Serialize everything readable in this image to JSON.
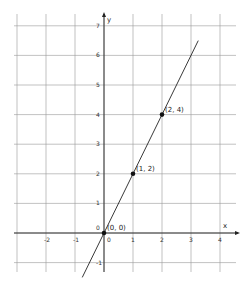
{
  "chart_data": {
    "type": "line",
    "title": "",
    "xlabel": "x",
    "ylabel": "y",
    "xlim": [
      -3,
      4.2
    ],
    "ylim": [
      -1.6,
      7.4
    ],
    "grid": true,
    "x_ticks": [
      -2,
      -1,
      0,
      1,
      2,
      3,
      4
    ],
    "y_ticks": [
      -1,
      0,
      1,
      2,
      3,
      4,
      5,
      6,
      7
    ],
    "series": [
      {
        "name": "y = 2x",
        "slope": 2,
        "intercept": 0,
        "x": [
          -0.75,
          1.7
        ],
        "y": [
          -1.5,
          3.4
        ]
      }
    ],
    "points": [
      {
        "x": 0,
        "y": 0,
        "label": "(0, 0)"
      },
      {
        "x": 1,
        "y": 2,
        "label": "(1, 2)"
      },
      {
        "x": 2,
        "y": 4,
        "label": "(2, 4)"
      }
    ],
    "origin_label": "0"
  }
}
